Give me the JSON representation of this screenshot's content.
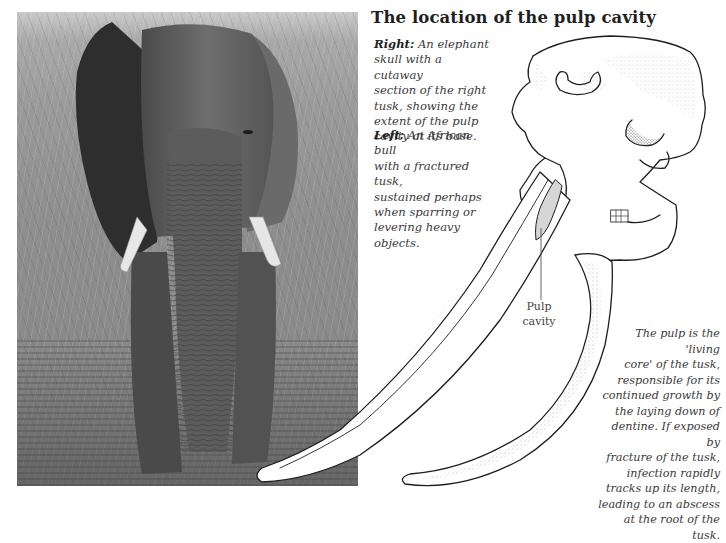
{
  "page": {
    "title": "The location of the pulp cavity"
  },
  "captions": {
    "right": {
      "lead": "Right:",
      "lines": [
        "An elephant",
        "skull with a cutaway",
        "section of the right",
        "tusk, showing the",
        "extent of the pulp",
        "cavity at its base."
      ]
    },
    "left": {
      "lead": "Left:",
      "lines": [
        "An African bull",
        "with a fractured tusk,",
        "sustained perhaps",
        "when sparring or",
        "levering heavy",
        "objects."
      ]
    }
  },
  "illustration": {
    "label_line1": "Pulp",
    "label_line2": "cavity",
    "subject": "elephant-skull-cutaway",
    "pulp_fill_color": "#d6d6d6"
  },
  "photo": {
    "subject": "african-bull-elephant-fractured-tusk",
    "tone": "grayscale"
  },
  "note": {
    "lines": [
      "The pulp is the 'living",
      "core' of the tusk,",
      "responsible for its",
      "continued growth by",
      "the laying down of",
      "dentine. If exposed by",
      "fracture of the tusk,",
      "infection rapidly",
      "tracks up its length,",
      "leading to an abscess",
      "at the root of the tusk."
    ]
  }
}
